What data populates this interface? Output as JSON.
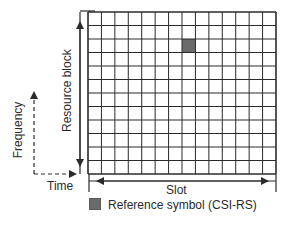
{
  "diagram": {
    "grid": {
      "columns": 14,
      "rows": 12,
      "line_color": "#2b2b2b",
      "cell_fill": "#ffffff",
      "highlighted_cells": [
        {
          "column": 7,
          "row": 2,
          "fill": "#6b6b6b"
        }
      ]
    },
    "labels": {
      "resource_block": "Resource block",
      "frequency": "Frequency",
      "time": "Time",
      "slot": "Slot"
    },
    "legend": {
      "items": [
        {
          "label": "Reference symbol (CSI-RS)",
          "color": "#6b6b6b"
        }
      ]
    }
  }
}
